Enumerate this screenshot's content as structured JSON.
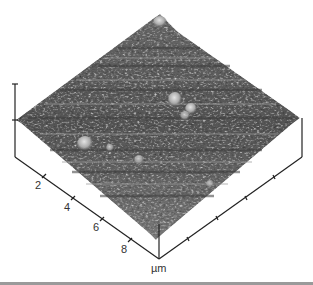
{
  "figure": {
    "type": "3D AFM surface topography",
    "colormap": "grayscale",
    "axis_unit": "µm",
    "x_axis_ticks": [
      "2",
      "4",
      "6",
      "8"
    ],
    "background_color": "#ffffff",
    "surface_dark": "#3a3a3a",
    "surface_light": "#d8d8d8"
  }
}
